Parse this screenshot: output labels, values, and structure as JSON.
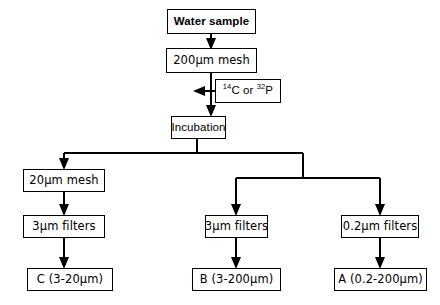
{
  "diagram": {
    "background_color": "#ffffff",
    "line_color": "#000000",
    "nodes": {
      "water_sample": "Water sample",
      "mesh_200": "200µm mesh",
      "isotope": "14C or 32P",
      "isotope_parts": {
        "mass_1": "14",
        "element_1": "C",
        "conjunction": " or ",
        "mass_2": "32",
        "element_2": "P"
      },
      "incubation": "Incubation",
      "mesh_20": "20µm mesh",
      "filters_3_left": "3µm filters",
      "filters_3_mid": "3µm filters",
      "filters_02_right": "0.2µm filters",
      "result_c": "C (3-20µm)",
      "result_b": "B (3-200µm)",
      "result_a": "A (0.2-200µm)"
    },
    "flow_order": [
      "Water sample",
      "200µm mesh",
      "Incubation",
      "20µm mesh",
      "3µm filters",
      "0.2µm filters",
      "C (3-20µm)",
      "B (3-200µm)",
      "A (0.2-200µm)"
    ]
  }
}
